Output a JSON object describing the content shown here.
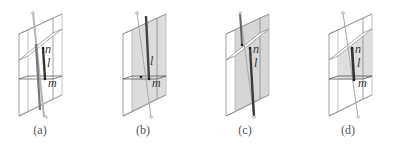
{
  "figure": {
    "panels": [
      {
        "id": "a",
        "caption": "(a)",
        "labels": {
          "n": "n",
          "l": "l",
          "m": "m"
        },
        "shaded": false,
        "slant_plane": true
      },
      {
        "id": "b",
        "caption": "(b)",
        "labels": {
          "n": "",
          "l": "l",
          "m": "m"
        },
        "shaded": true,
        "slant_plane": false
      },
      {
        "id": "c",
        "caption": "(c)",
        "labels": {
          "n": "n",
          "l": "l",
          "m": ""
        },
        "shaded": true,
        "slant_plane": true
      },
      {
        "id": "d",
        "caption": "(d)",
        "labels": {
          "n": "n",
          "l": "l",
          "m": "m"
        },
        "shaded": true,
        "slant_plane": true
      }
    ],
    "colors": {
      "outline": "#8a8a8a",
      "shade": "#d4d4d4",
      "segment": "#3a3a3a",
      "axis": "#9a9a9a",
      "text": "#333333"
    }
  }
}
